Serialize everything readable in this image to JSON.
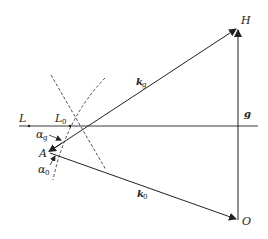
{
  "diagram": {
    "type": "vector-geometry",
    "points": {
      "H": {
        "label": "H",
        "x": 238,
        "y": 28
      },
      "O": {
        "label": "O",
        "x": 238,
        "y": 220
      },
      "A": {
        "label": "A",
        "x": 48,
        "y": 152
      },
      "L": {
        "label": "L",
        "x": 29,
        "y": 126
      },
      "L0": {
        "label": "L",
        "sub": "0",
        "x": 70,
        "y": 126
      }
    },
    "vectors": {
      "k_g": {
        "label": "k",
        "sub": "g"
      },
      "k_0": {
        "label": "k",
        "sub": "0"
      },
      "g": {
        "label": "g"
      }
    },
    "angles": {
      "alpha_g": {
        "label": "α",
        "sub": "g"
      },
      "alpha_0": {
        "label": "α",
        "sub": "0"
      }
    },
    "colors": {
      "line": "#222222",
      "background": "#ffffff"
    }
  }
}
